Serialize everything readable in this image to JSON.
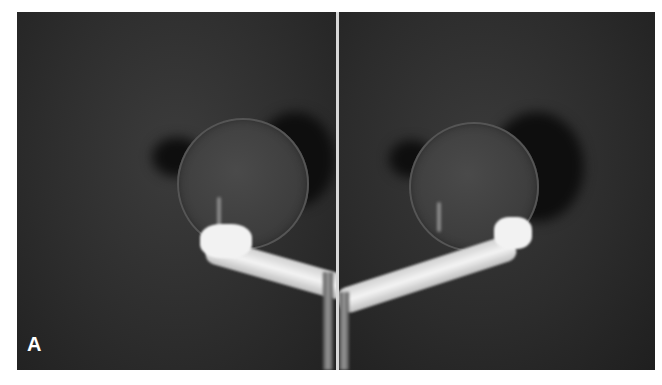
{
  "figure": {
    "panel_label": "A",
    "panels": [
      {
        "id": "left",
        "description": "radiograph of humeral head with intramedullary fixation rod"
      },
      {
        "id": "right",
        "description": "mirrored radiograph of humeral head with intramedullary fixation rod"
      }
    ],
    "colors": {
      "background": "#2f2f2f",
      "divider": "#d8d8d8",
      "implant": "#f2f2f2",
      "label": "#ffffff"
    }
  }
}
